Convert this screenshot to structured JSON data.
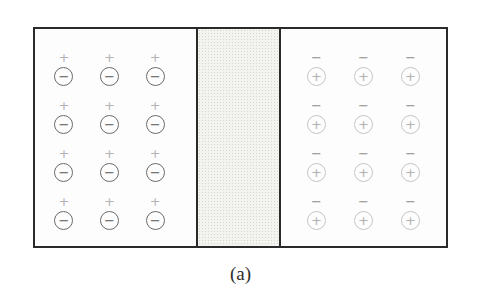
{
  "figure": {
    "caption": "(a)",
    "border_color": "#2a2a2a",
    "background": "#ffffff",
    "regions": {
      "left": {
        "name": "left-negative-charge-region",
        "rows": 4,
        "cols": 3,
        "unit": {
          "top_symbol": "+",
          "top_symbol_name": "plus-icon",
          "circle_symbol": "−",
          "circle_name": "circled-minus-icon",
          "unit_name": "negative-charge-unit"
        },
        "colors": {
          "top_symbol": "#b4b4b4",
          "circle_stroke": "#6b6b6b",
          "circle_symbol": "#565656"
        }
      },
      "middle": {
        "name": "stippled-gap-band",
        "fill": "#f3f3ef",
        "dot_color": "#d6d6d0"
      },
      "right": {
        "name": "right-positive-charge-region",
        "rows": 4,
        "cols": 3,
        "unit": {
          "top_symbol": "−",
          "top_symbol_name": "minus-icon",
          "circle_symbol": "+",
          "circle_name": "circled-plus-icon",
          "unit_name": "positive-charge-unit"
        },
        "colors": {
          "top_symbol": "#8c8c8c",
          "circle_stroke": "#c6c6c6",
          "circle_symbol": "#b2b2b2"
        }
      }
    }
  }
}
